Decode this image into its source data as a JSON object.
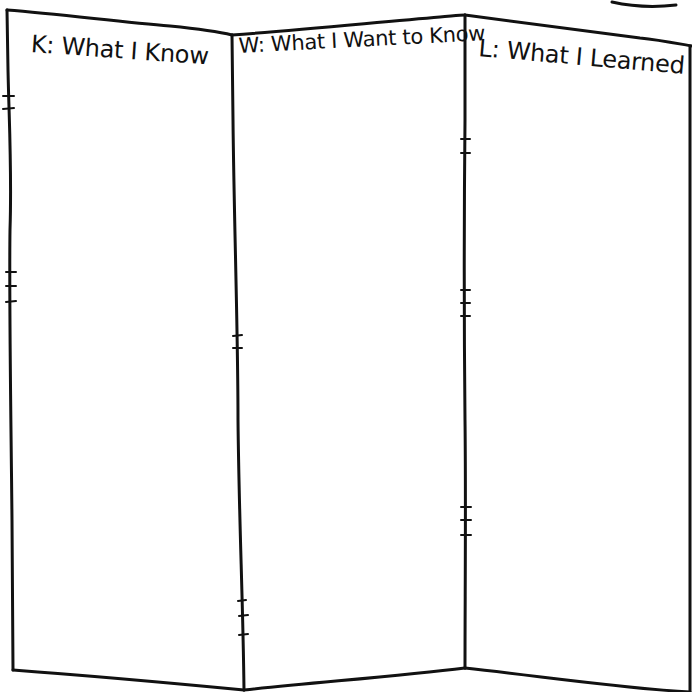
{
  "chart": {
    "type": "KWL worksheet",
    "columns": [
      {
        "key": "K",
        "label": "K: What I Know"
      },
      {
        "key": "W",
        "label": "W: What I Want to Know"
      },
      {
        "key": "L",
        "label": "L: What I Learned"
      }
    ]
  },
  "style": {
    "ink_color": "#111111",
    "paper_color": "#ffffff"
  }
}
